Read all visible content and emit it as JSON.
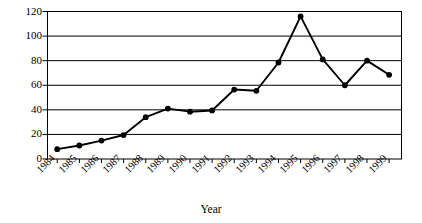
{
  "chart_data": {
    "type": "line",
    "title": "",
    "xlabel": "Year",
    "ylabel": "",
    "categories": [
      "1984",
      "1985",
      "1986",
      "1987",
      "1988",
      "1989",
      "1990",
      "1991",
      "1992",
      "1993",
      "1994",
      "1995",
      "1996",
      "1997",
      "1998",
      "1999"
    ],
    "values": [
      8,
      11,
      15,
      19.5,
      34,
      41,
      38.5,
      39.5,
      56.5,
      55.5,
      78.5,
      116,
      81,
      60,
      80,
      68.5
    ],
    "series": [
      {
        "name": "series-1",
        "values": [
          8,
          11,
          15,
          19.5,
          34,
          41,
          38.5,
          39.5,
          56.5,
          55.5,
          78.5,
          116,
          81,
          60,
          80,
          68.5
        ]
      }
    ],
    "ylim": [
      0,
      120
    ],
    "yticks": [
      0,
      20,
      40,
      60,
      80,
      100,
      120
    ],
    "ytick_labels": [
      "0",
      "20",
      "40",
      "60",
      "80",
      "100",
      "120"
    ],
    "xtick_labels": [
      "1984",
      "1985",
      "1986",
      "1987",
      "1988",
      "1989",
      "1990",
      "1991",
      "1992",
      "1993",
      "1994",
      "1995",
      "1996",
      "1997",
      "1998",
      "1999"
    ],
    "grid": true,
    "grid_axis": "y",
    "legend": false,
    "legend_position": "none",
    "marker": "filled-circle",
    "line_color": "#000000",
    "marker_color": "#000000",
    "grid_color": "#000000",
    "background_color": "#ffffff",
    "plot_border": true,
    "xtick_label_rotation": -45
  },
  "axis": {
    "x_title": "Year"
  }
}
